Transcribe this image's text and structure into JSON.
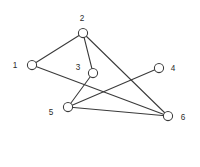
{
  "figure": {
    "kind": "undirected-graph-diagram",
    "width": 200,
    "height": 167,
    "background_color": "#ffffff",
    "stroke_color": "#3a3a3a",
    "label_color": "#2b2b2b",
    "node_fill_color": "#ffffff",
    "node_radius": 4.6
  },
  "nodes": [
    {
      "id": "1",
      "label": "1",
      "x": 32,
      "y": 65,
      "label_x": 15,
      "label_y": 66,
      "label_anchor": "middle"
    },
    {
      "id": "2",
      "label": "2",
      "x": 83,
      "y": 33,
      "label_x": 82,
      "label_y": 19,
      "label_anchor": "middle"
    },
    {
      "id": "3",
      "label": "3",
      "x": 93,
      "y": 73,
      "label_x": 78,
      "label_y": 68,
      "label_anchor": "middle"
    },
    {
      "id": "4",
      "label": "4",
      "x": 159,
      "y": 68,
      "label_x": 173,
      "label_y": 69,
      "label_anchor": "middle"
    },
    {
      "id": "5",
      "label": "5",
      "x": 68,
      "y": 107,
      "label_x": 51,
      "label_y": 113,
      "label_anchor": "middle"
    },
    {
      "id": "6",
      "label": "6",
      "x": 168,
      "y": 116,
      "label_x": 183,
      "label_y": 118,
      "label_anchor": "middle"
    }
  ],
  "edges": [
    {
      "id": "e-1-2",
      "source": "1",
      "target": "2",
      "x1": 32,
      "y1": 65,
      "x2": 83,
      "y2": 33
    },
    {
      "id": "e-1-6",
      "source": "1",
      "target": "6",
      "x1": 32,
      "y1": 65,
      "x2": 168,
      "y2": 116
    },
    {
      "id": "e-2-3",
      "source": "2",
      "target": "3",
      "x1": 83,
      "y1": 33,
      "x2": 93,
      "y2": 73
    },
    {
      "id": "e-2-6",
      "source": "2",
      "target": "6",
      "x1": 83,
      "y1": 33,
      "x2": 168,
      "y2": 116
    },
    {
      "id": "e-3-5",
      "source": "3",
      "target": "5",
      "x1": 93,
      "y1": 73,
      "x2": 68,
      "y2": 107
    },
    {
      "id": "e-4-5",
      "source": "4",
      "target": "5",
      "x1": 159,
      "y1": 68,
      "x2": 68,
      "y2": 107
    },
    {
      "id": "e-5-6",
      "source": "5",
      "target": "6",
      "x1": 68,
      "y1": 107,
      "x2": 168,
      "y2": 116
    }
  ]
}
